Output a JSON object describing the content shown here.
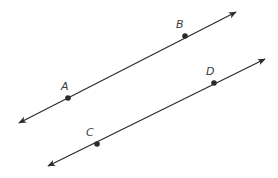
{
  "diagram": {
    "type": "parallel-lines",
    "stroke_color": "#2b2b2b",
    "lines": [
      {
        "name": "line-AB",
        "start": [
          19,
          123
        ],
        "end": [
          236,
          12
        ],
        "points": [
          {
            "label": "A",
            "pos": [
              68,
              98
            ],
            "label_pos": [
              61,
              90
            ]
          },
          {
            "label": "B",
            "pos": [
              185,
              36
            ],
            "label_pos": [
              176,
              28
            ]
          }
        ]
      },
      {
        "name": "line-CD",
        "start": [
          48,
          166
        ],
        "end": [
          265,
          59
        ],
        "points": [
          {
            "label": "C",
            "pos": [
              97,
              144
            ],
            "label_pos": [
              86,
              136
            ]
          },
          {
            "label": "D",
            "pos": [
              214,
              83
            ],
            "label_pos": [
              206,
              75
            ]
          }
        ]
      }
    ]
  }
}
